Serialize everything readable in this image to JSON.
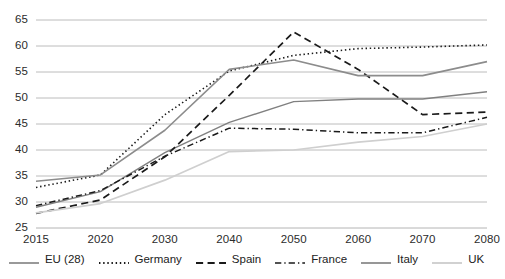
{
  "chart_data": {
    "type": "line",
    "title": "",
    "xlabel": "",
    "ylabel": "",
    "categories": [
      "2015",
      "2020",
      "2030",
      "2040",
      "2050",
      "2060",
      "2070",
      "2080"
    ],
    "x_tick_labels": [
      "2015",
      "2020",
      "2030",
      "2040",
      "2050",
      "2060",
      "2070",
      "2080"
    ],
    "y_tick_labels": [
      "25",
      "30",
      "35",
      "40",
      "45",
      "50",
      "55",
      "60",
      "65"
    ],
    "y_ticks": [
      25,
      30,
      35,
      40,
      45,
      50,
      55,
      60,
      65
    ],
    "ylim": [
      25,
      65
    ],
    "grid": "horizontal",
    "legend_position": "bottom",
    "series": [
      {
        "name": "EU (28)",
        "style": "solid",
        "color": "#808080",
        "width": 1.4,
        "values": [
          29.0,
          32.0,
          39.5,
          45.3,
          49.3,
          49.8,
          49.8,
          51.2
        ]
      },
      {
        "name": "Germany",
        "style": "dotted",
        "color": "#1a1a1a",
        "width": 1.6,
        "values": [
          32.8,
          35.2,
          46.8,
          55.2,
          58.2,
          59.5,
          59.8,
          60.2
        ]
      },
      {
        "name": "Spain",
        "style": "dashed",
        "color": "#1a1a1a",
        "width": 1.7,
        "values": [
          27.8,
          30.4,
          38.7,
          50.5,
          62.7,
          55.5,
          46.8,
          47.3
        ]
      },
      {
        "name": "France",
        "style": "dashdot",
        "color": "#1a1a1a",
        "width": 1.5,
        "values": [
          29.3,
          32.2,
          38.8,
          44.2,
          44.0,
          43.3,
          43.3,
          46.3
        ]
      },
      {
        "name": "Italy",
        "style": "solid",
        "color": "#8c8c8c",
        "width": 1.6,
        "values": [
          34.0,
          35.2,
          43.8,
          55.5,
          57.3,
          54.3,
          54.3,
          57.0
        ]
      },
      {
        "name": "UK",
        "style": "solid",
        "color": "#cfcfcf",
        "width": 1.7,
        "values": [
          27.9,
          29.7,
          34.2,
          39.7,
          40.0,
          41.5,
          42.6,
          45.0
        ]
      }
    ]
  },
  "legend": {
    "items": [
      {
        "label": "EU (28)"
      },
      {
        "label": "Germany"
      },
      {
        "label": "Spain"
      },
      {
        "label": "France"
      },
      {
        "label": "Italy"
      },
      {
        "label": "UK"
      }
    ]
  }
}
